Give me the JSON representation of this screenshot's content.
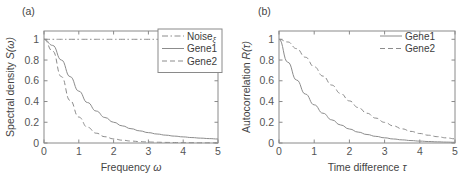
{
  "figure": {
    "background": "#ffffff",
    "axis_color": "#8a8a8a",
    "text_color": "#444444",
    "curve_color": "#8c8c8c"
  },
  "panels": [
    {
      "tag": "(a)",
      "xlabel_main": "Frequency",
      "xlabel_symbol": "ω",
      "ylabel_main": "Spectral density",
      "ylabel_symbol": "S(ω)",
      "xticks": [
        "0",
        "1",
        "2",
        "3",
        "4",
        "5"
      ],
      "yticks": [
        "0",
        "0.2",
        "0.4",
        "0.6",
        "0.8",
        "1"
      ],
      "legend": {
        "boxed": true,
        "entries": [
          {
            "label": "Noise",
            "sub": "ξ",
            "style": "dashdot"
          },
          {
            "label": "Gene1",
            "sub": "",
            "style": "solid"
          },
          {
            "label": "Gene2",
            "sub": "",
            "style": "dashed"
          }
        ]
      }
    },
    {
      "tag": "(b)",
      "xlabel_main": "Time difference",
      "xlabel_symbol": "τ",
      "ylabel_main": "Autocorrelation",
      "ylabel_symbol": "R(τ)",
      "xticks": [
        "0",
        "1",
        "2",
        "3",
        "4",
        "5"
      ],
      "yticks": [
        "0",
        "0.2",
        "0.4",
        "0.6",
        "0.8",
        "1"
      ],
      "legend": {
        "boxed": false,
        "entries": [
          {
            "label": "Gene1",
            "sub": "",
            "style": "solid"
          },
          {
            "label": "Gene2",
            "sub": "",
            "style": "dashed"
          }
        ]
      }
    }
  ],
  "chart_data": [
    {
      "type": "line",
      "panel": "(a)",
      "title": "",
      "xlabel": "Frequency ω",
      "ylabel": "Spectral density S(ω)",
      "xlim": [
        0,
        5
      ],
      "ylim": [
        0,
        1.08
      ],
      "grid": false,
      "legend_position": "top-right",
      "x": [
        0,
        0.25,
        0.5,
        0.75,
        1,
        1.25,
        1.5,
        1.75,
        2,
        2.25,
        2.5,
        2.75,
        3,
        3.25,
        3.5,
        3.75,
        4,
        4.25,
        4.5,
        4.75,
        5
      ],
      "series": [
        {
          "name": "Noiseξ",
          "style": "dashdot",
          "values": [
            1,
            1,
            1,
            1,
            1,
            1,
            1,
            1,
            1,
            1,
            1,
            1,
            1,
            1,
            1,
            1,
            1,
            1,
            1,
            1,
            1
          ]
        },
        {
          "name": "Gene1",
          "style": "solid",
          "values": [
            1.0,
            0.941,
            0.8,
            0.64,
            0.5,
            0.39,
            0.308,
            0.246,
            0.2,
            0.165,
            0.138,
            0.117,
            0.1,
            0.0865,
            0.0755,
            0.0663,
            0.0588,
            0.0524,
            0.047,
            0.0424,
            0.0385
          ]
        },
        {
          "name": "Gene2",
          "style": "dashed",
          "values": [
            1.0,
            0.886,
            0.64,
            0.41,
            0.25,
            0.152,
            0.0947,
            0.0606,
            0.04,
            0.0272,
            0.019,
            0.0136,
            0.01,
            0.00748,
            0.0057,
            0.0044,
            0.00346,
            0.00275,
            0.00221,
            0.0018,
            0.00148
          ]
        }
      ]
    },
    {
      "type": "line",
      "panel": "(b)",
      "title": "",
      "xlabel": "Time difference τ",
      "ylabel": "Autocorrelation R(τ)",
      "xlim": [
        0,
        5
      ],
      "ylim": [
        0,
        1.08
      ],
      "grid": false,
      "legend_position": "top-right",
      "x": [
        0,
        0.25,
        0.5,
        0.75,
        1,
        1.25,
        1.5,
        1.75,
        2,
        2.25,
        2.5,
        2.75,
        3,
        3.25,
        3.5,
        3.75,
        4,
        4.25,
        4.5,
        4.75,
        5
      ],
      "series": [
        {
          "name": "Gene1",
          "style": "solid",
          "values": [
            1.0,
            0.779,
            0.607,
            0.472,
            0.368,
            0.287,
            0.223,
            0.174,
            0.135,
            0.105,
            0.082,
            0.064,
            0.05,
            0.0388,
            0.0302,
            0.0235,
            0.0183,
            0.0143,
            0.0111,
            0.0087,
            0.0067
          ]
        },
        {
          "name": "Gene2",
          "style": "dashed",
          "values": [
            1.0,
            0.974,
            0.91,
            0.827,
            0.736,
            0.645,
            0.558,
            0.478,
            0.406,
            0.342,
            0.287,
            0.24,
            0.199,
            0.165,
            0.136,
            0.112,
            0.0916,
            0.0748,
            0.0611,
            0.0497,
            0.0404
          ]
        }
      ]
    }
  ]
}
